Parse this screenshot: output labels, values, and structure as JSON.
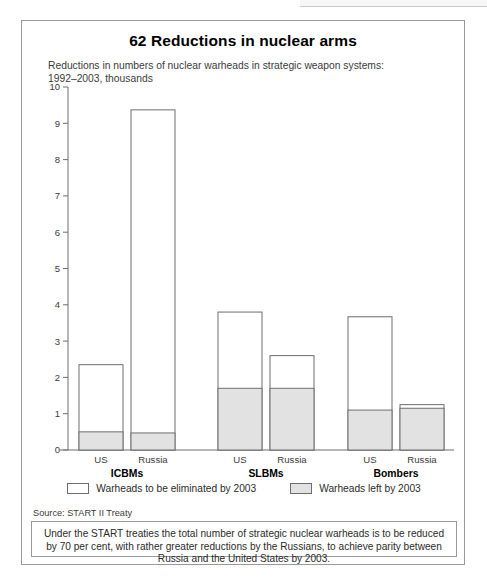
{
  "figure": {
    "title": "62 Reductions in nuclear arms",
    "subtitle": "Reductions in numbers of nuclear warheads in strategic weapon systems: 1992–2003, thousands",
    "source": "Source: START II Treaty",
    "footnote": "Under the START treaties the total number of strategic nuclear warheads is to be reduced by 70 per cent, with rather greater reductions by the Russians, to achieve parity between Russia and the United States by 2003."
  },
  "legend": {
    "items": [
      {
        "label": "Warheads to be eliminated by 2003",
        "swatch": "outline",
        "color": "#ffffff"
      },
      {
        "label": "Warheads left by 2003",
        "swatch": "filled",
        "color": "#e2e2e2"
      }
    ]
  },
  "chart_data": {
    "type": "bar",
    "title": "62 Reductions in nuclear arms",
    "subtitle": "Reductions in numbers of nuclear warheads in strategic weapon systems: 1992–2003, thousands",
    "xlabel": "",
    "ylabel": "thousands",
    "ylim": [
      0,
      10
    ],
    "yticks": [
      0,
      1,
      2,
      3,
      4,
      5,
      6,
      7,
      8,
      9,
      10
    ],
    "ytick_labels": [
      "0",
      "1",
      "2",
      "3",
      "4",
      "5",
      "6",
      "7",
      "8",
      "9",
      "10"
    ],
    "grid": false,
    "stacked": true,
    "legend_position": "bottom",
    "groups": [
      "ICBMs",
      "SLBMs",
      "Bombers"
    ],
    "categories": [
      "US",
      "Russia",
      "US",
      "Russia",
      "US",
      "Russia"
    ],
    "series": [
      {
        "name": "Warheads left by 2003",
        "color": "#e2e2e2",
        "values": [
          0.5,
          0.47,
          1.7,
          1.7,
          1.1,
          1.15
        ]
      },
      {
        "name": "Warheads to be eliminated by 2003",
        "color": "#ffffff",
        "values": [
          1.85,
          8.9,
          2.1,
          0.9,
          2.57,
          0.1
        ]
      }
    ],
    "totals": [
      2.35,
      9.37,
      3.8,
      2.6,
      3.67,
      1.25
    ],
    "bars": [
      {
        "group": "ICBMs",
        "country": "US",
        "total": 2.35,
        "left_by_2003": 0.5,
        "to_be_eliminated": 1.85
      },
      {
        "group": "ICBMs",
        "country": "Russia",
        "total": 9.37,
        "left_by_2003": 0.47,
        "to_be_eliminated": 8.9
      },
      {
        "group": "SLBMs",
        "country": "US",
        "total": 3.8,
        "left_by_2003": 1.7,
        "to_be_eliminated": 2.1
      },
      {
        "group": "SLBMs",
        "country": "Russia",
        "total": 2.6,
        "left_by_2003": 1.7,
        "to_be_eliminated": 0.9
      },
      {
        "group": "Bombers",
        "country": "US",
        "total": 3.67,
        "left_by_2003": 1.1,
        "to_be_eliminated": 2.57
      },
      {
        "group": "Bombers",
        "country": "Russia",
        "total": 1.25,
        "left_by_2003": 1.15,
        "to_be_eliminated": 0.1
      }
    ]
  }
}
